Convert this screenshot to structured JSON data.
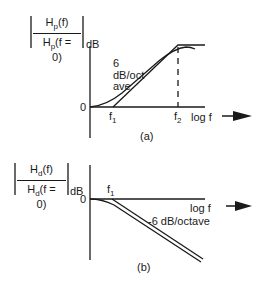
{
  "panel_a": {
    "numerator": "H",
    "numerator_sub": "p",
    "numerator_arg": "(f)",
    "denominator": "H",
    "denominator_sub": "p",
    "denominator_arg": "(f = 0)",
    "unit": "dB",
    "zero_label": "0",
    "f1_label": "f",
    "f1_sub": "1",
    "f2_label": "f",
    "f2_sub": "2",
    "x_label": "log f",
    "slope_label_1": "6",
    "slope_label_2": "dB/oct",
    "slope_label_3": "ave",
    "caption": "(a)"
  },
  "panel_b": {
    "numerator": "H",
    "numerator_sub": "d",
    "numerator_arg": "(f)",
    "denominator": "H",
    "denominator_sub": "d",
    "denominator_arg": "(f = 0)",
    "unit": "dB",
    "zero_label": "0",
    "f1_label": "f",
    "f1_sub": "1",
    "x_label": "log f",
    "slope_label": "-6 dB/octave",
    "caption": "(b)"
  },
  "colors": {
    "line": "#1a1a1a",
    "background": "#ffffff"
  }
}
